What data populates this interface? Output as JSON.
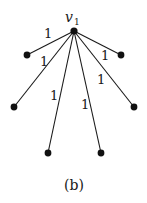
{
  "diagram": {
    "type": "star-graph",
    "caption": "(b)",
    "center": {
      "id": "v1",
      "label": "v",
      "subscript": "1",
      "x": 74,
      "y": 31
    },
    "leaves": [
      {
        "id": "leaf-1",
        "x": 27,
        "y": 55
      },
      {
        "id": "leaf-2",
        "x": 121,
        "y": 55
      },
      {
        "id": "leaf-3",
        "x": 14,
        "y": 107
      },
      {
        "id": "leaf-4",
        "x": 134,
        "y": 107
      },
      {
        "id": "leaf-5",
        "x": 48,
        "y": 153
      },
      {
        "id": "leaf-6",
        "x": 101,
        "y": 153
      }
    ],
    "edges": [
      {
        "from": "v1",
        "to": "leaf-1",
        "weight": "1"
      },
      {
        "from": "v1",
        "to": "leaf-2",
        "weight": "1"
      },
      {
        "from": "v1",
        "to": "leaf-3",
        "weight": "1"
      },
      {
        "from": "v1",
        "to": "leaf-4",
        "weight": "1"
      },
      {
        "from": "v1",
        "to": "leaf-5",
        "weight": "1"
      },
      {
        "from": "v1",
        "to": "leaf-6",
        "weight": "1"
      }
    ]
  }
}
